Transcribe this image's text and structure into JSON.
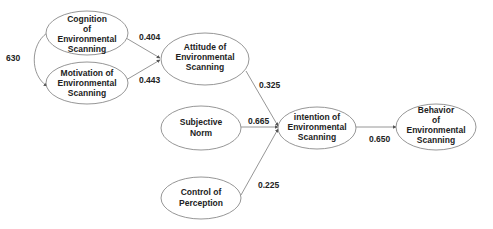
{
  "diagram": {
    "type": "path-model",
    "nodes": [
      {
        "id": "cognition",
        "lines": [
          "Cognition",
          "of",
          "Environmental",
          "Scanning"
        ]
      },
      {
        "id": "motivation",
        "lines": [
          "Motivation of",
          "Environmental",
          "Scanning"
        ]
      },
      {
        "id": "attitude",
        "lines": [
          "Attitude of",
          "Environmental",
          "Scanning"
        ]
      },
      {
        "id": "subjective_norm",
        "lines": [
          "Subjective",
          "Norm"
        ]
      },
      {
        "id": "control",
        "lines": [
          "Control of",
          "Perception"
        ]
      },
      {
        "id": "intention",
        "lines": [
          "intention of",
          "Environmental",
          "Scanning"
        ]
      },
      {
        "id": "behavior",
        "lines": [
          "Behavior",
          "of",
          "Environmental",
          "Scanning"
        ]
      }
    ],
    "edges": [
      {
        "from": "cognition",
        "to": "motivation",
        "label": "630",
        "kind": "correlation"
      },
      {
        "from": "cognition",
        "to": "attitude",
        "label": "0.404"
      },
      {
        "from": "motivation",
        "to": "attitude",
        "label": "0.443"
      },
      {
        "from": "attitude",
        "to": "intention",
        "label": "0.325"
      },
      {
        "from": "subjective_norm",
        "to": "intention",
        "label": "0.665"
      },
      {
        "from": "control",
        "to": "intention",
        "label": "0.225"
      },
      {
        "from": "intention",
        "to": "behavior",
        "label": "0.650"
      }
    ]
  }
}
